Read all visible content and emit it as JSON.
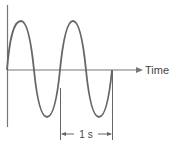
{
  "diagram": {
    "axis_label_x": "Time",
    "period_label": "1 s",
    "colors": {
      "wave": "#666666",
      "axis": "#777777",
      "text": "#444444"
    }
  }
}
